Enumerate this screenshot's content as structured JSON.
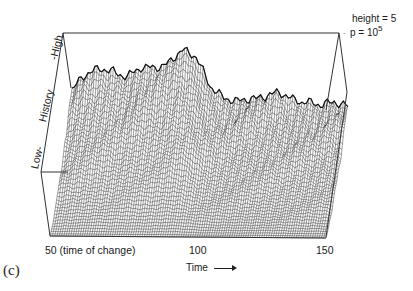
{
  "chart_data": {
    "type": "surface-3d-wireframe",
    "panel_label": "(c)",
    "title": "",
    "annotation": {
      "height_label": "height = 5",
      "p_label": "p = 10",
      "p_exponent": "5"
    },
    "xaxis": {
      "label": "Time",
      "arrow": "→",
      "ticks": [
        {
          "value": 50,
          "label": "50  (time of change)"
        },
        {
          "value": 100,
          "label": "100"
        },
        {
          "value": 150,
          "label": "150"
        }
      ],
      "range": [
        50,
        150
      ]
    },
    "yaxis": {
      "label": "History",
      "low_label": "Low-",
      "high_label": "-High"
    },
    "zaxis": {
      "label": "height",
      "max": 5
    },
    "grid": false,
    "surface_profile": {
      "description": "Ridge heights (relative 0-1) along the back edge, per time step",
      "x": [
        50,
        55,
        60,
        65,
        70,
        75,
        80,
        85,
        90,
        95,
        100,
        105,
        110,
        115,
        120,
        125,
        130,
        135,
        140,
        145,
        150
      ],
      "back_ridge": [
        0.55,
        0.62,
        0.65,
        0.66,
        0.64,
        0.7,
        0.7,
        0.72,
        0.78,
        0.74,
        0.58,
        0.5,
        0.48,
        0.5,
        0.49,
        0.5,
        0.47,
        0.48,
        0.46,
        0.48,
        0.45
      ]
    }
  },
  "labels": {
    "panel": "(c)",
    "tick_50": "50  (time of change)",
    "tick_100": "100",
    "tick_150": "150",
    "time": "Time",
    "history": "History",
    "low": "Low-",
    "high": "-High",
    "height": "height = 5",
    "p": "p = 10",
    "p_exp": "5"
  }
}
